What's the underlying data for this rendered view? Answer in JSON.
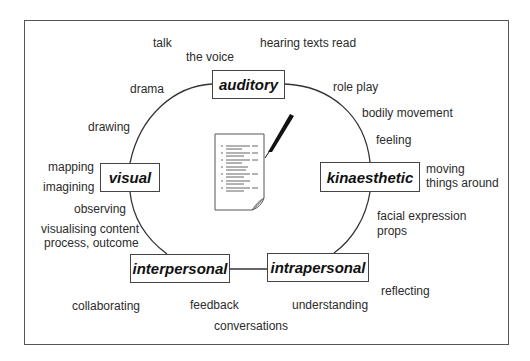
{
  "diagram": {
    "center_icon": "document-with-pen-icon",
    "nodes": [
      {
        "id": "auditory",
        "label": "auditory"
      },
      {
        "id": "visual",
        "label": "visual"
      },
      {
        "id": "kinaesthetic",
        "label": "kinaesthetic"
      },
      {
        "id": "interpersonal",
        "label": "interpersonal"
      },
      {
        "id": "intrapersonal",
        "label": "intrapersonal"
      }
    ],
    "labels": {
      "talk": "talk",
      "the_voice": "the voice",
      "hearing_texts_read": "hearing texts read",
      "drama": "drama",
      "role_play": "role play",
      "bodily_movement": "bodily movement",
      "drawing": "drawing",
      "feeling": "feeling",
      "mapping": "mapping",
      "imagining": "imagining",
      "moving_things_around_1": "moving",
      "moving_things_around_2": "things around",
      "observing": "observing",
      "facial_expression": "facial expression",
      "props": "props",
      "visualising_1": "visualising content",
      "visualising_2": "process, outcome",
      "reflecting": "reflecting",
      "collaborating": "collaborating",
      "feedback": "feedback",
      "understanding": "understanding",
      "conversations": "conversations"
    }
  }
}
